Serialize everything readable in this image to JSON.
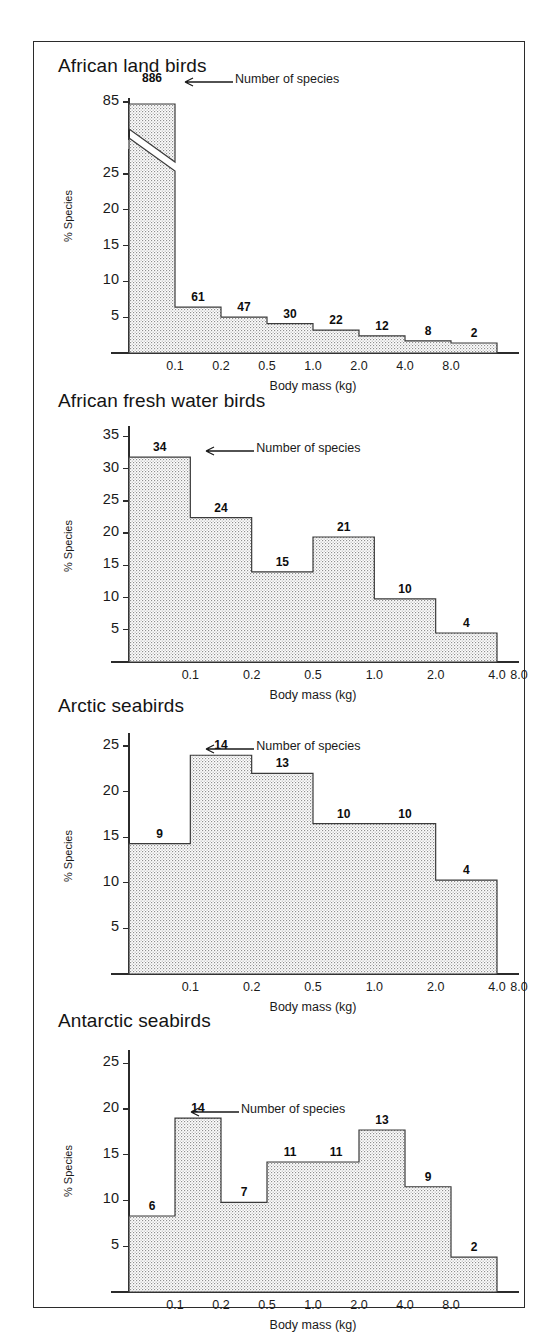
{
  "figure": {
    "background": "#ffffff",
    "frame_color": "#2b2b2b",
    "bar_fill": "#f2f2f2",
    "bar_stroke": "#3a3a3a",
    "annotation_text": "Number of species",
    "xlabel": "Body mass (kg)",
    "ylabel": "% Species"
  },
  "chart_data": [
    {
      "type": "bar",
      "title": "African land birds",
      "xlabel": "Body mass (kg)",
      "ylabel": "% Species",
      "categories": [
        "0.05-0.1",
        "0.1-0.2",
        "0.2-0.5",
        "0.5-1.0",
        "1.0-2.0",
        "2.0-4.0",
        "4.0-8.0",
        "8.0-16.0"
      ],
      "tick_labels_x": [
        "0.1",
        "0.2",
        "0.5",
        "1.0",
        "2.0",
        "4.0",
        "8.0"
      ],
      "tick_labels_y": [
        "5",
        "10",
        "15",
        "20",
        "25",
        "85"
      ],
      "tick_values_y": [
        5,
        10,
        15,
        20,
        25,
        85
      ],
      "axis_break": true,
      "axis_break_between": [
        25,
        85
      ],
      "ylim": [
        0,
        88
      ],
      "values": [
        86.0,
        6.4,
        5.0,
        4.1,
        3.2,
        2.4,
        1.7,
        1.4
      ],
      "data_labels": [
        "886",
        "61",
        "47",
        "30",
        "22",
        "12",
        "8",
        "2"
      ],
      "counts": [
        886,
        61,
        47,
        30,
        22,
        12,
        8,
        2
      ],
      "annotation": "Number of species",
      "grid": false,
      "legend": "none"
    },
    {
      "type": "bar",
      "title": "African fresh water birds",
      "xlabel": "Body mass (kg)",
      "ylabel": "% Species",
      "categories": [
        "0.05-0.1",
        "0.1-0.2",
        "0.2-0.5",
        "0.5-1.0",
        "1.0-2.0",
        "2.0-4.0"
      ],
      "tick_labels_x": [
        "0.1",
        "0.2",
        "0.5",
        "1.0",
        "2.0",
        "4.0",
        "8.0"
      ],
      "tick_labels_y": [
        "5",
        "10",
        "15",
        "20",
        "25",
        "30",
        "35"
      ],
      "tick_values_y": [
        5,
        10,
        15,
        20,
        25,
        30,
        35
      ],
      "axis_break": false,
      "ylim": [
        0,
        36
      ],
      "values": [
        31.8,
        22.4,
        14.0,
        19.4,
        9.8,
        4.5
      ],
      "data_labels": [
        "34",
        "24",
        "15",
        "21",
        "10",
        "4"
      ],
      "counts": [
        34,
        24,
        15,
        21,
        10,
        4
      ],
      "annotation": "Number of species",
      "grid": false,
      "legend": "none"
    },
    {
      "type": "bar",
      "title": "Arctic seabirds",
      "xlabel": "Body mass (kg)",
      "ylabel": "% Species",
      "categories": [
        "0.05-0.1",
        "0.1-0.2",
        "0.2-0.5",
        "0.5-1.0",
        "1.0-2.0",
        "2.0-4.0"
      ],
      "tick_labels_x": [
        "0.1",
        "0.2",
        "0.5",
        "1.0",
        "2.0",
        "4.0",
        "8.0"
      ],
      "tick_labels_y": [
        "5",
        "10",
        "15",
        "20",
        "25"
      ],
      "tick_values_y": [
        5,
        10,
        15,
        20,
        25
      ],
      "axis_break": false,
      "ylim": [
        0,
        26
      ],
      "values": [
        14.3,
        24.0,
        22.0,
        16.5,
        16.5,
        10.3
      ],
      "data_labels": [
        "9",
        "14",
        "13",
        "10",
        "10",
        "4"
      ],
      "counts": [
        9,
        14,
        13,
        10,
        10,
        4
      ],
      "annotation": "Number of species",
      "grid": false,
      "legend": "none"
    },
    {
      "type": "bar",
      "title": "Antarctic seabirds",
      "xlabel": "Body mass (kg)",
      "ylabel": "% Species",
      "categories": [
        "0.05-0.1",
        "0.1-0.2",
        "0.2-0.5",
        "0.5-1.0",
        "1.0-2.0",
        "2.0-4.0",
        "4.0-8.0",
        "8.0-16.0"
      ],
      "tick_labels_x": [
        "0.1",
        "0.2",
        "0.5",
        "1.0",
        "2.0",
        "4.0",
        "8.0"
      ],
      "tick_labels_y": [
        "5",
        "10",
        "15",
        "20",
        "25"
      ],
      "tick_values_y": [
        5,
        10,
        15,
        20,
        25
      ],
      "axis_break": false,
      "ylim": [
        0,
        26
      ],
      "values": [
        8.3,
        19.0,
        9.8,
        14.2,
        14.2,
        17.7,
        11.5,
        3.8
      ],
      "data_labels": [
        "6",
        "14",
        "7",
        "11",
        "11",
        "13",
        "9",
        "2"
      ],
      "counts": [
        6,
        14,
        7,
        11,
        11,
        13,
        9,
        2
      ],
      "annotation": "Number of species",
      "grid": false,
      "legend": "none"
    }
  ]
}
